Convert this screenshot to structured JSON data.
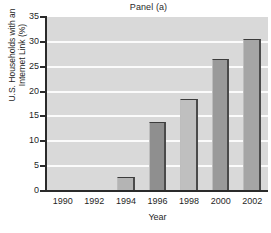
{
  "chart_data": {
    "type": "bar",
    "title": "Panel (a)",
    "xlabel": "Year",
    "ylabel": "U.S. Households with an Internet Link (%)",
    "ylabel_lines": [
      "U.S. Households with an",
      "Internet Link (%)"
    ],
    "categories": [
      "1990",
      "1992",
      "1994",
      "1996",
      "1998",
      "2000",
      "2002"
    ],
    "values": [
      0.3,
      0.3,
      2.8,
      13.8,
      18.6,
      26.6,
      30.5
    ],
    "bar_colors": [
      "#a8a8a8",
      "#a8a8a8",
      "#b4b4b4",
      "#8f8f8f",
      "#bfbfbf",
      "#9a9a9a",
      "#a5a5a5"
    ],
    "ylim": [
      0,
      35
    ],
    "yticks": [
      0,
      5,
      10,
      15,
      20,
      25,
      30,
      35
    ],
    "ytick_labels": [
      "0",
      "5",
      "10",
      "15",
      "20",
      "25",
      "30",
      "35"
    ],
    "grid": true,
    "grid_color": "#fbfbfb",
    "legend": null,
    "plot_background": "#d9d9d9",
    "axis_color": "#2a2a2a"
  }
}
